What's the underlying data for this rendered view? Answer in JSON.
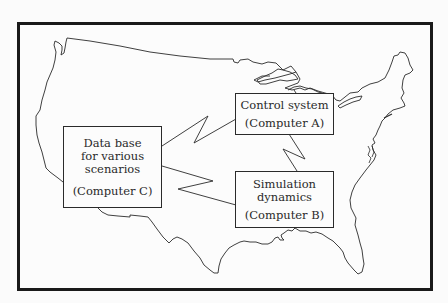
{
  "diagram": {
    "type": "network-diagram-on-us-map",
    "background_map": "continental-us-outline",
    "nodes": [
      {
        "id": "C",
        "title_lines": [
          "Data base",
          "for various",
          "scenarios"
        ],
        "computer_label": "(Computer C)"
      },
      {
        "id": "A",
        "title_lines": [
          "Control system"
        ],
        "computer_label": "(Computer A)"
      },
      {
        "id": "B",
        "title_lines": [
          "Simulation",
          "dynamics"
        ],
        "computer_label": "(Computer B)"
      }
    ],
    "links": [
      {
        "from": "C",
        "to": "A",
        "style": "lightning-zigzag"
      },
      {
        "from": "C",
        "to": "B",
        "style": "lightning-zigzag"
      },
      {
        "from": "A",
        "to": "B",
        "style": "lightning-zigzag"
      }
    ],
    "colors": {
      "stroke": "#2a2a2a",
      "frame": "#1a1a1a",
      "background": "#fcfcfc"
    }
  }
}
